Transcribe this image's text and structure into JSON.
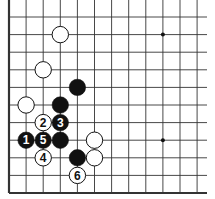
{
  "board": {
    "origin_x": 9,
    "origin_y": 17,
    "spacing_x": 17.1,
    "spacing_y": 17.6,
    "cols": 12,
    "rows": 11,
    "line_color": "#333333",
    "edge_left": true,
    "edge_bottom": true,
    "edge_top": false,
    "edge_right": false,
    "extend_right_to": 207,
    "extend_top_to": 0
  },
  "star_points": [
    {
      "col": 9,
      "row": 1
    },
    {
      "col": 9,
      "row": 7
    }
  ],
  "stones": [
    {
      "color": "white",
      "col": 3,
      "row": 1,
      "label": ""
    },
    {
      "color": "white",
      "col": 2,
      "row": 3,
      "label": ""
    },
    {
      "color": "black",
      "col": 4,
      "row": 4,
      "label": ""
    },
    {
      "color": "white",
      "col": 1,
      "row": 5,
      "label": ""
    },
    {
      "color": "black",
      "col": 3,
      "row": 5,
      "label": ""
    },
    {
      "color": "white",
      "col": 2,
      "row": 6,
      "label": "2"
    },
    {
      "color": "black",
      "col": 3,
      "row": 6,
      "label": "3"
    },
    {
      "color": "black",
      "col": 1,
      "row": 7,
      "label": "1"
    },
    {
      "color": "black",
      "col": 2,
      "row": 7,
      "label": "5"
    },
    {
      "color": "black",
      "col": 3,
      "row": 7,
      "label": ""
    },
    {
      "color": "white",
      "col": 5,
      "row": 7,
      "label": ""
    },
    {
      "color": "white",
      "col": 2,
      "row": 8,
      "label": "4"
    },
    {
      "color": "black",
      "col": 4,
      "row": 8,
      "label": ""
    },
    {
      "color": "white",
      "col": 5,
      "row": 8,
      "label": ""
    },
    {
      "color": "white",
      "col": 4,
      "row": 9,
      "label": "6"
    }
  ]
}
